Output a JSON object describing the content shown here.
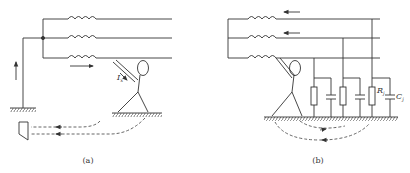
{
  "figure": {
    "panels": [
      {
        "id": "a",
        "caption": "(a)",
        "labels": {
          "current": "I",
          "current_sub": "x"
        }
      },
      {
        "id": "b",
        "caption": "(b)",
        "labels": {
          "resistor": "R",
          "resistor_sub": "j",
          "capacitor": "C",
          "capacitor_sub": "j"
        }
      }
    ],
    "colors": {
      "line": "#333333",
      "dash": "#555555",
      "background": "#ffffff"
    }
  }
}
